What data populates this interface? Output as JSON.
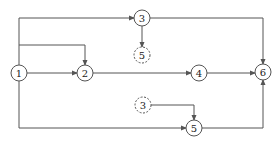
{
  "diagram": {
    "type": "activity-network",
    "colors": {
      "line": "#555555",
      "text": "#222222",
      "background": "#ffffff"
    },
    "nodes": [
      {
        "id": "n1",
        "label": "1",
        "x": 19,
        "y": 73,
        "style": "solid"
      },
      {
        "id": "n2",
        "label": "2",
        "x": 85,
        "y": 73,
        "style": "solid"
      },
      {
        "id": "n3",
        "label": "3",
        "x": 142,
        "y": 18,
        "style": "solid"
      },
      {
        "id": "n5d",
        "label": "5",
        "x": 142,
        "y": 55,
        "style": "dashed"
      },
      {
        "id": "n4",
        "label": "4",
        "x": 199,
        "y": 73,
        "style": "solid"
      },
      {
        "id": "n6",
        "label": "6",
        "x": 263,
        "y": 72,
        "style": "solid"
      },
      {
        "id": "n3d",
        "label": "3",
        "x": 143,
        "y": 105,
        "style": "dashed"
      },
      {
        "id": "n5",
        "label": "5",
        "x": 194,
        "y": 128,
        "style": "solid"
      }
    ],
    "edges": [
      {
        "from": "1",
        "to": "2",
        "path": "direct"
      },
      {
        "from": "1",
        "to": "2",
        "path": "up-over-down"
      },
      {
        "from": "1",
        "to": "3",
        "path": "up-over"
      },
      {
        "from": "3",
        "to": "5 (dashed)",
        "path": "down"
      },
      {
        "from": "3",
        "to": "6",
        "path": "over-down"
      },
      {
        "from": "2",
        "to": "4",
        "path": "direct"
      },
      {
        "from": "4",
        "to": "6",
        "path": "direct"
      },
      {
        "from": "1",
        "to": "5",
        "path": "down-over"
      },
      {
        "from": "3 (dashed)",
        "to": "5",
        "path": "over-down"
      },
      {
        "from": "5",
        "to": "6",
        "path": "over-up"
      }
    ]
  }
}
